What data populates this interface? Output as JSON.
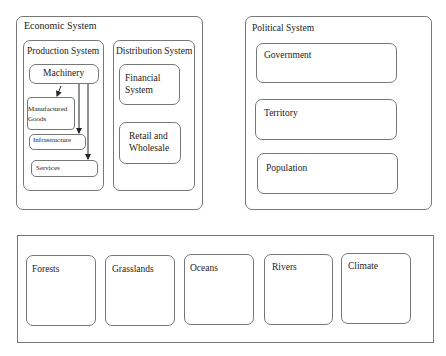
{
  "economic": {
    "title": "Economic System",
    "production": {
      "title": "Production System",
      "machinery": "Machinery",
      "manufactured_line1": "Manufactured",
      "manufactured_line2": "Goods",
      "infrastructure": "Infrastructure",
      "services": "Services"
    },
    "distribution": {
      "title": "Distribution System",
      "financial_line1": "Financial",
      "financial_line2": "System",
      "retail_line1": "Retail and",
      "retail_line2": "Wholesale"
    }
  },
  "political": {
    "title": "Political System",
    "items": [
      "Government",
      "Territory",
      "Population"
    ]
  },
  "environment": {
    "items": [
      "Forests",
      "Grasslands",
      "Oceans",
      "Rivers",
      "Climate"
    ]
  },
  "colors": {
    "border": "#777777",
    "text": "#222222",
    "background": "#ffffff"
  }
}
